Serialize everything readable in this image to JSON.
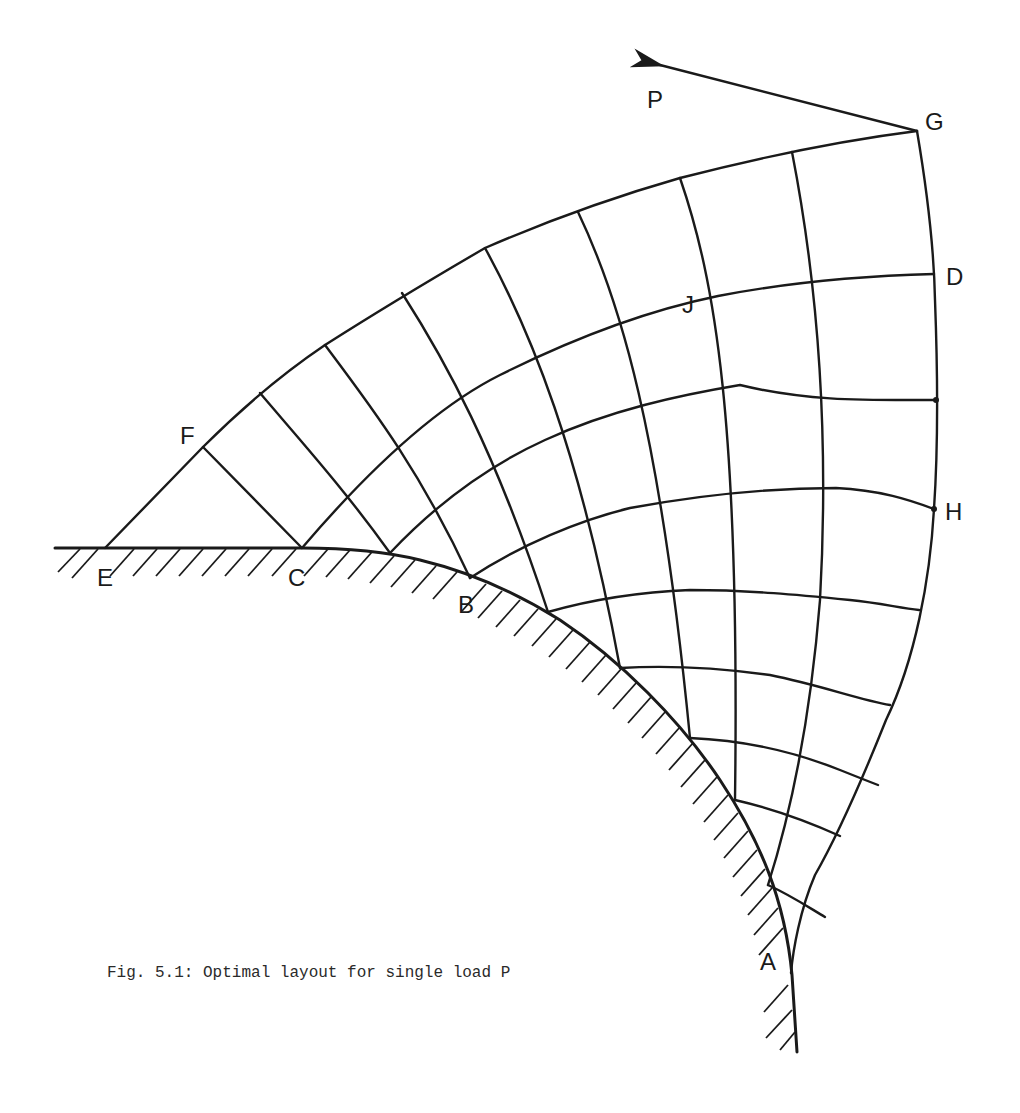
{
  "figure": {
    "caption": "Fig. 5.1: Optimal layout for single load P",
    "type": "structural layout (Michell-type truss) diagram",
    "stroke_color": "#1a1a1a",
    "background": "#ffffff"
  },
  "labels": {
    "P": "P",
    "G": "G",
    "D": "D",
    "J": "J",
    "F": "F",
    "H": "H",
    "E": "E",
    "C": "C",
    "B": "B",
    "A": "A"
  },
  "elements": {
    "load_arrow": {
      "label": "P",
      "from_node": "G",
      "direction": "up-left"
    },
    "support": {
      "description": "fixed support: horizontal segment E–C blending into circular arc through B to A",
      "hatched": true
    },
    "nodes": [
      "A",
      "B",
      "C",
      "D",
      "E",
      "F",
      "G",
      "H",
      "J"
    ]
  }
}
